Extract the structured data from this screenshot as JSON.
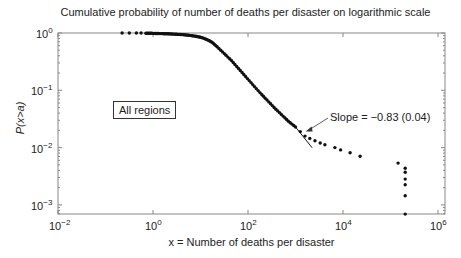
{
  "chart_data": {
    "type": "scatter",
    "title": "Cumulative probability of number of deaths per disaster on logarithmic scale",
    "xlabel": "x = Number of deaths per disaster",
    "ylabel": "P(x>a)",
    "xscale": "log",
    "yscale": "log",
    "xlim": [
      0.01,
      1000000
    ],
    "ylim": [
      0.0007,
      1
    ],
    "x_ticks": [
      "10^-2",
      "10^0",
      "10^2",
      "10^4",
      "10^6"
    ],
    "y_ticks": [
      "10^0",
      "10^-1",
      "10^-2",
      "10^-3"
    ],
    "grid": false,
    "legend": null,
    "annotations": [
      {
        "text": "All regions",
        "type": "boxed-label"
      },
      {
        "text": "Slope = −0.83 (0.04)",
        "type": "arrow",
        "points_to_log10": [
          3.15,
          -1.72
        ]
      }
    ],
    "fit_line": {
      "slope": -0.83,
      "stderr": 0.04,
      "log10_x_range": [
        3.0,
        3.35
      ]
    },
    "series": [
      {
        "name": "All regions",
        "marker": "dot",
        "points_log10": [
          [
            -0.65,
            0.0
          ],
          [
            -0.5,
            0.0
          ],
          [
            -0.35,
            0.0
          ],
          [
            -0.25,
            0.0
          ],
          [
            -0.15,
            -0.005
          ],
          [
            -0.05,
            -0.005
          ],
          [
            0.05,
            -0.008
          ],
          [
            0.15,
            -0.01
          ],
          [
            0.25,
            -0.012
          ],
          [
            0.35,
            -0.015
          ],
          [
            0.45,
            -0.02
          ],
          [
            0.55,
            -0.025
          ],
          [
            0.65,
            -0.03
          ],
          [
            0.75,
            -0.04
          ],
          [
            0.85,
            -0.05
          ],
          [
            0.95,
            -0.065
          ],
          [
            1.05,
            -0.085
          ],
          [
            1.15,
            -0.12
          ],
          [
            1.24,
            -0.16
          ],
          [
            1.35,
            -0.24
          ],
          [
            1.5,
            -0.36
          ],
          [
            1.65,
            -0.48
          ],
          [
            1.8,
            -0.62
          ],
          [
            1.95,
            -0.76
          ],
          [
            2.1,
            -0.9
          ],
          [
            2.25,
            -1.04
          ],
          [
            2.4,
            -1.17
          ],
          [
            2.55,
            -1.3
          ],
          [
            2.7,
            -1.42
          ],
          [
            2.85,
            -1.54
          ],
          [
            3.0,
            -1.64
          ],
          [
            3.1,
            -1.72
          ],
          [
            3.2,
            -1.8
          ],
          [
            3.3,
            -1.84
          ],
          [
            3.41,
            -1.88
          ],
          [
            3.52,
            -1.92
          ],
          [
            3.62,
            -1.95
          ],
          [
            3.83,
            -2.0
          ],
          [
            3.95,
            -2.04
          ],
          [
            4.15,
            -2.09
          ],
          [
            4.36,
            -2.15
          ],
          [
            5.16,
            -2.27
          ],
          [
            5.31,
            -2.36
          ],
          [
            5.31,
            -2.43
          ],
          [
            5.31,
            -2.55
          ],
          [
            5.31,
            -2.65
          ],
          [
            5.31,
            -2.84
          ],
          [
            5.31,
            -3.16
          ]
        ]
      }
    ]
  },
  "labels": {
    "title": "Cumulative probability of number of deaths per disaster on logarithmic scale",
    "xlabel": "x = Number of deaths per disaster",
    "ylabel": "P(x>a)",
    "region_label": "All regions",
    "slope_annotation": "Slope = −0.83 (0.04)",
    "xticks": [
      {
        "base": "10",
        "exp": "−2"
      },
      {
        "base": "10",
        "exp": "0"
      },
      {
        "base": "10",
        "exp": "2"
      },
      {
        "base": "10",
        "exp": "4"
      },
      {
        "base": "10",
        "exp": "6"
      }
    ],
    "yticks": [
      {
        "base": "10",
        "exp": "0"
      },
      {
        "base": "10",
        "exp": "−1"
      },
      {
        "base": "10",
        "exp": "−2"
      },
      {
        "base": "10",
        "exp": "−3"
      }
    ]
  },
  "colors": {
    "axis": "#888888",
    "marker": "#111111",
    "text": "#222222"
  }
}
